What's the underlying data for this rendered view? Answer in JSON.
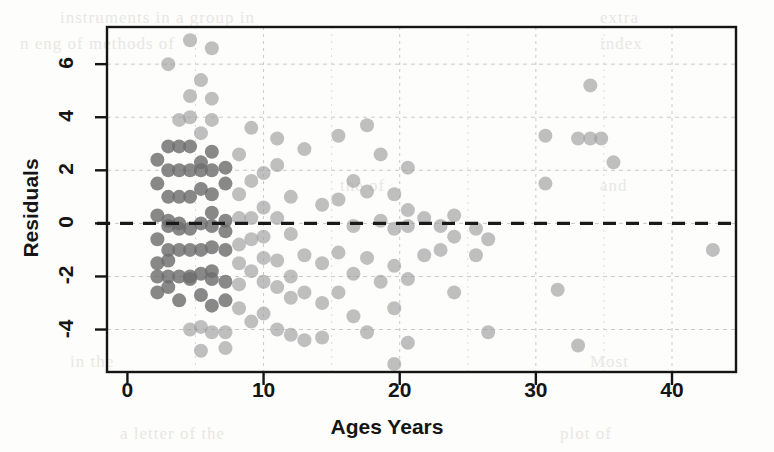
{
  "figure": {
    "background": "#fdfdfc",
    "ink_color": "#151515",
    "grid_color": "#c9c9c9",
    "point_color": "#9a9a9a",
    "point_color_dark": "#6e6e6e",
    "zero_line_color": "#1a1a1a"
  },
  "ghost_background_text": [
    {
      "text": "instruments in a group in",
      "x": 60,
      "y": 8
    },
    {
      "text": "extra",
      "x": 600,
      "y": 8
    },
    {
      "text": "n eng of methods of",
      "x": 20,
      "y": 34
    },
    {
      "text": "index",
      "x": 600,
      "y": 34
    },
    {
      "text": "the of",
      "x": 340,
      "y": 176
    },
    {
      "text": "and",
      "x": 600,
      "y": 176
    },
    {
      "text": "Most",
      "x": 590,
      "y": 352
    },
    {
      "text": "in the",
      "x": 70,
      "y": 352
    },
    {
      "text": "a letter of the",
      "x": 120,
      "y": 424
    },
    {
      "text": "plot of",
      "x": 560,
      "y": 424
    }
  ],
  "chart_data": {
    "type": "scatter",
    "title": "",
    "xlabel": "Ages Years",
    "ylabel": "Residuals",
    "xlim": [
      -1.5,
      44.7
    ],
    "ylim": [
      -5.6,
      7.4
    ],
    "xticks": [
      0,
      10,
      20,
      30,
      40
    ],
    "yticks": [
      -4,
      -2,
      0,
      2,
      4,
      6
    ],
    "xtick_labels": [
      "0",
      "10",
      "20",
      "30",
      "40"
    ],
    "ytick_labels": [
      "-4",
      "-2",
      "0",
      "2",
      "4",
      "6"
    ],
    "grid": true,
    "grid_style": "dotted",
    "legend": null,
    "reference_lines": [
      {
        "orientation": "horizontal",
        "value": 0,
        "style": "dashed",
        "label": "zero residual line"
      }
    ],
    "marker": {
      "shape": "circle",
      "size": 7,
      "alpha": 0.65
    },
    "points": [
      [
        2.2,
        2.4
      ],
      [
        2.2,
        1.5
      ],
      [
        2.2,
        0.3
      ],
      [
        2.2,
        -0.6
      ],
      [
        2.2,
        -1.5
      ],
      [
        2.2,
        -2.0
      ],
      [
        2.2,
        -2.6
      ],
      [
        3.0,
        6.0
      ],
      [
        3.0,
        2.9
      ],
      [
        3.0,
        2.0
      ],
      [
        3.0,
        1.0
      ],
      [
        3.0,
        0.1
      ],
      [
        3.0,
        -0.1
      ],
      [
        3.0,
        -1.0
      ],
      [
        3.0,
        -1.4
      ],
      [
        3.0,
        -2.0
      ],
      [
        3.0,
        -2.4
      ],
      [
        3.8,
        3.9
      ],
      [
        3.8,
        2.9
      ],
      [
        3.8,
        2.0
      ],
      [
        3.8,
        1.0
      ],
      [
        3.8,
        0.0
      ],
      [
        3.8,
        -0.2
      ],
      [
        3.8,
        -1.0
      ],
      [
        3.8,
        -2.0
      ],
      [
        3.8,
        -2.9
      ],
      [
        4.6,
        6.9
      ],
      [
        4.6,
        4.8
      ],
      [
        4.6,
        4.0
      ],
      [
        4.6,
        2.9
      ],
      [
        4.6,
        2.0
      ],
      [
        4.6,
        1.0
      ],
      [
        4.6,
        -0.2
      ],
      [
        4.6,
        -1.0
      ],
      [
        4.6,
        -2.0
      ],
      [
        4.6,
        -2.1
      ],
      [
        4.6,
        -4.0
      ],
      [
        5.4,
        5.4
      ],
      [
        5.4,
        3.4
      ],
      [
        5.4,
        2.3
      ],
      [
        5.4,
        2.0
      ],
      [
        5.4,
        1.3
      ],
      [
        5.4,
        0.0
      ],
      [
        5.4,
        -1.0
      ],
      [
        5.4,
        -1.9
      ],
      [
        5.4,
        -2.7
      ],
      [
        5.4,
        -3.9
      ],
      [
        5.4,
        -4.8
      ],
      [
        6.2,
        6.6
      ],
      [
        6.2,
        4.7
      ],
      [
        6.2,
        3.9
      ],
      [
        6.2,
        2.7
      ],
      [
        6.2,
        2.0
      ],
      [
        6.2,
        1.1
      ],
      [
        6.2,
        0.4
      ],
      [
        6.2,
        -0.1
      ],
      [
        6.2,
        -0.9
      ],
      [
        6.2,
        -1.8
      ],
      [
        6.2,
        -2.1
      ],
      [
        6.2,
        -3.1
      ],
      [
        6.2,
        -4.1
      ],
      [
        7.2,
        2.1
      ],
      [
        7.2,
        1.5
      ],
      [
        7.2,
        0.1
      ],
      [
        7.2,
        -0.3
      ],
      [
        7.2,
        -1.0
      ],
      [
        7.2,
        -2.2
      ],
      [
        7.2,
        -2.9
      ],
      [
        7.2,
        -4.1
      ],
      [
        7.2,
        -4.7
      ],
      [
        8.2,
        2.6
      ],
      [
        8.2,
        1.1
      ],
      [
        8.2,
        0.2
      ],
      [
        8.2,
        -0.8
      ],
      [
        8.2,
        -1.5
      ],
      [
        8.2,
        -2.3
      ],
      [
        8.2,
        -3.2
      ],
      [
        9.1,
        3.6
      ],
      [
        9.1,
        1.6
      ],
      [
        9.1,
        0.2
      ],
      [
        9.1,
        -0.6
      ],
      [
        9.1,
        -1.8
      ],
      [
        9.1,
        -3.7
      ],
      [
        10.0,
        1.9
      ],
      [
        10.0,
        0.6
      ],
      [
        10.0,
        -0.5
      ],
      [
        10.0,
        -1.3
      ],
      [
        10.0,
        -2.2
      ],
      [
        10.0,
        -3.4
      ],
      [
        11.0,
        3.2
      ],
      [
        11.0,
        2.2
      ],
      [
        11.0,
        0.2
      ],
      [
        11.0,
        -1.4
      ],
      [
        11.0,
        -2.4
      ],
      [
        11.0,
        -4.0
      ],
      [
        12.0,
        1.0
      ],
      [
        12.0,
        -0.4
      ],
      [
        12.0,
        -2.0
      ],
      [
        12.0,
        -2.8
      ],
      [
        12.0,
        -4.2
      ],
      [
        13.0,
        2.8
      ],
      [
        13.0,
        -1.2
      ],
      [
        13.0,
        -2.6
      ],
      [
        13.0,
        -4.4
      ],
      [
        14.3,
        0.7
      ],
      [
        14.3,
        -1.5
      ],
      [
        14.3,
        -3.0
      ],
      [
        14.3,
        -4.3
      ],
      [
        15.5,
        3.3
      ],
      [
        15.5,
        0.9
      ],
      [
        15.5,
        -1.1
      ],
      [
        15.5,
        -2.6
      ],
      [
        16.6,
        1.6
      ],
      [
        16.6,
        -0.1
      ],
      [
        16.6,
        -1.9
      ],
      [
        16.6,
        -3.5
      ],
      [
        17.6,
        3.7
      ],
      [
        17.6,
        1.2
      ],
      [
        17.6,
        -1.3
      ],
      [
        17.6,
        -4.1
      ],
      [
        18.6,
        2.6
      ],
      [
        18.6,
        0.1
      ],
      [
        18.6,
        -2.2
      ],
      [
        19.6,
        1.1
      ],
      [
        19.6,
        -0.2
      ],
      [
        19.6,
        -1.6
      ],
      [
        19.6,
        -3.2
      ],
      [
        19.6,
        -5.3
      ],
      [
        20.6,
        2.1
      ],
      [
        20.6,
        0.5
      ],
      [
        20.6,
        -0.1
      ],
      [
        20.6,
        -2.1
      ],
      [
        20.6,
        -4.5
      ],
      [
        21.8,
        0.2
      ],
      [
        21.8,
        -1.2
      ],
      [
        23.0,
        -0.1
      ],
      [
        23.0,
        -1.0
      ],
      [
        24.0,
        0.3
      ],
      [
        24.0,
        -0.5
      ],
      [
        24.0,
        -2.6
      ],
      [
        25.6,
        -0.2
      ],
      [
        25.6,
        -1.2
      ],
      [
        26.5,
        -0.6
      ],
      [
        26.5,
        -4.1
      ],
      [
        30.7,
        1.5
      ],
      [
        30.7,
        3.3
      ],
      [
        31.6,
        -2.5
      ],
      [
        33.1,
        3.2
      ],
      [
        33.1,
        -4.6
      ],
      [
        34.0,
        5.2
      ],
      [
        34.0,
        3.2
      ],
      [
        34.8,
        3.2
      ],
      [
        35.7,
        2.3
      ],
      [
        43.0,
        -1.0
      ]
    ]
  }
}
